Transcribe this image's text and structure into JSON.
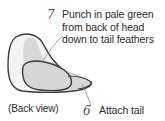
{
  "steps": [
    {
      "number": "7",
      "lines": [
        "Punch in pale green",
        "from back of head",
        "down to tail feathers"
      ]
    },
    {
      "number": "6",
      "lines": [
        "Attach tail"
      ]
    }
  ],
  "caption": "(Back view)",
  "colors": {
    "outline": "#3a3a3a",
    "body_fill": "#f2f2f2",
    "shade_fill": "#d9d9d9",
    "tail_fill": "#cfcfcf",
    "leader_line": "#8a8a8a",
    "text": "#2b2b2b"
  }
}
